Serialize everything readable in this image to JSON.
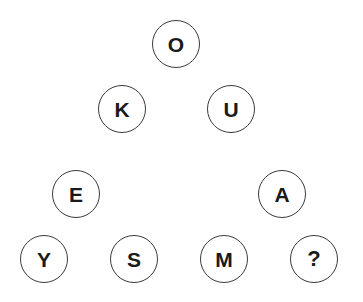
{
  "canvas": {
    "width": 363,
    "height": 302,
    "background_color": "#ffffff"
  },
  "style": {
    "circle_stroke_color": "#3a3a3a",
    "circle_stroke_width": 1.5,
    "circle_fill_color": "#ffffff",
    "letter_color": "#1a1a1a",
    "letter_font_size": 21,
    "circle_diameter": 48
  },
  "nodes": [
    {
      "id": "node-o",
      "label": "O",
      "x": 152,
      "y": 20,
      "size": 48,
      "row": 1,
      "font_size": 21
    },
    {
      "id": "node-k",
      "label": "K",
      "x": 98,
      "y": 85,
      "size": 48,
      "row": 2,
      "font_size": 21
    },
    {
      "id": "node-u",
      "label": "U",
      "x": 207,
      "y": 85,
      "size": 48,
      "row": 2,
      "font_size": 21
    },
    {
      "id": "node-e",
      "label": "E",
      "x": 52,
      "y": 170,
      "size": 48,
      "row": 3,
      "font_size": 21
    },
    {
      "id": "node-a",
      "label": "A",
      "x": 258,
      "y": 170,
      "size": 48,
      "row": 3,
      "font_size": 21
    },
    {
      "id": "node-y",
      "label": "Y",
      "x": 20,
      "y": 235,
      "size": 48,
      "row": 4,
      "font_size": 21
    },
    {
      "id": "node-s",
      "label": "S",
      "x": 110,
      "y": 235,
      "size": 48,
      "row": 4,
      "font_size": 21
    },
    {
      "id": "node-m",
      "label": "M",
      "x": 200,
      "y": 235,
      "size": 48,
      "row": 4,
      "font_size": 21
    },
    {
      "id": "node-q",
      "label": "?",
      "x": 290,
      "y": 235,
      "size": 48,
      "row": 4,
      "font_size": 22
    }
  ]
}
